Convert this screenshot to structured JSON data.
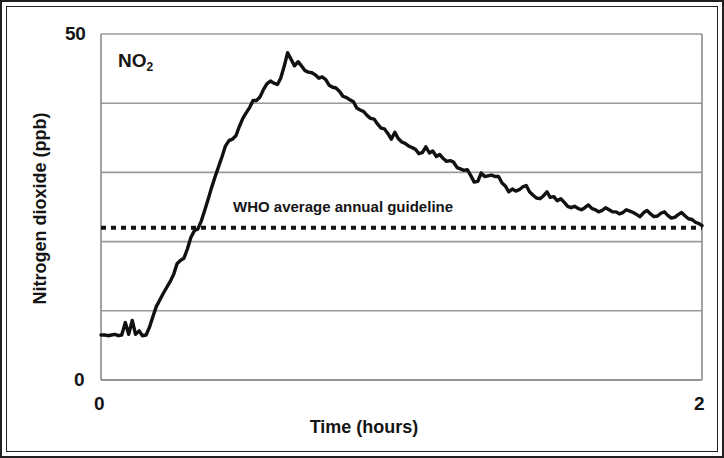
{
  "figure": {
    "series_label": "NO",
    "series_label_sub": "2",
    "annotation": "WHO average annual guideline"
  },
  "axes": {
    "x_title": "Time (hours)",
    "y_title": "Nitrogen dioxide (ppb)",
    "x_tick_min": "0",
    "x_tick_max": "2",
    "y_tick_min": "0",
    "y_tick_max": "50"
  },
  "colors": {
    "line": "#111111",
    "grid": "#9a9a9a",
    "axis": "#8c8c8c",
    "frame": "#231f20",
    "background": "#ffffff"
  },
  "chart_data": {
    "type": "line",
    "title": "",
    "xlabel": "Time (hours)",
    "ylabel": "Nitrogen dioxide (ppb)",
    "xlim": [
      0,
      2
    ],
    "ylim": [
      0,
      50
    ],
    "grid": true,
    "gridlines_y": [
      0,
      10,
      20,
      30,
      40,
      50
    ],
    "xticks": [
      0,
      2
    ],
    "yticks": [
      0,
      50
    ],
    "legend": "none",
    "annotations": [
      {
        "text": "NO2",
        "x": 0.09,
        "y": 46,
        "kind": "series-label"
      },
      {
        "text": "WHO average annual guideline",
        "x": 0.44,
        "y": 24.3,
        "kind": "threshold-label"
      }
    ],
    "threshold_line": {
      "label": "WHO average annual guideline",
      "value": 22.0,
      "style": "dotted",
      "orientation": "horizontal"
    },
    "series": [
      {
        "name": "NO2",
        "units": "ppb",
        "x": [
          0.0,
          0.012,
          0.023,
          0.035,
          0.046,
          0.058,
          0.069,
          0.081,
          0.092,
          0.104,
          0.115,
          0.127,
          0.138,
          0.15,
          0.161,
          0.173,
          0.184,
          0.196,
          0.207,
          0.219,
          0.23,
          0.242,
          0.253,
          0.265,
          0.276,
          0.288,
          0.299,
          0.311,
          0.322,
          0.334,
          0.345,
          0.357,
          0.368,
          0.38,
          0.391,
          0.403,
          0.414,
          0.426,
          0.437,
          0.449,
          0.46,
          0.472,
          0.483,
          0.495,
          0.506,
          0.518,
          0.529,
          0.541,
          0.552,
          0.564,
          0.575,
          0.587,
          0.598,
          0.61,
          0.621,
          0.633,
          0.644,
          0.656,
          0.667,
          0.679,
          0.69,
          0.702,
          0.713,
          0.725,
          0.736,
          0.748,
          0.759,
          0.771,
          0.782,
          0.794,
          0.805,
          0.817,
          0.828,
          0.84,
          0.851,
          0.863,
          0.874,
          0.886,
          0.897,
          0.909,
          0.92,
          0.932,
          0.943,
          0.955,
          0.966,
          0.978,
          0.989,
          1.001,
          1.012,
          1.024,
          1.035,
          1.047,
          1.058,
          1.07,
          1.081,
          1.093,
          1.104,
          1.116,
          1.127,
          1.139,
          1.15,
          1.162,
          1.173,
          1.185,
          1.196,
          1.208,
          1.219,
          1.231,
          1.242,
          1.254,
          1.265,
          1.277,
          1.288,
          1.3,
          1.311,
          1.323,
          1.334,
          1.346,
          1.357,
          1.369,
          1.38,
          1.392,
          1.403,
          1.415,
          1.426,
          1.438,
          1.449,
          1.461,
          1.472,
          1.484,
          1.495,
          1.507,
          1.518,
          1.53,
          1.541,
          1.553,
          1.564,
          1.576,
          1.587,
          1.599,
          1.61,
          1.622,
          1.633,
          1.645,
          1.656,
          1.668,
          1.679,
          1.691,
          1.702,
          1.714,
          1.725,
          1.737,
          1.748,
          1.76,
          1.771,
          1.783,
          1.794,
          1.806,
          1.817,
          1.829,
          1.84,
          1.852,
          1.863,
          1.875,
          1.886,
          1.898,
          1.909,
          1.921,
          1.932,
          1.944,
          1.955,
          1.967,
          1.978,
          1.99,
          2.0
        ],
        "y": [
          6.5,
          6.5,
          6.4,
          6.5,
          6.6,
          6.4,
          6.5,
          8.3,
          6.6,
          8.6,
          6.6,
          7.1,
          6.4,
          6.5,
          7.6,
          9.2,
          10.6,
          11.6,
          12.5,
          13.4,
          14.2,
          15.3,
          16.8,
          17.3,
          17.6,
          19.0,
          20.6,
          21.6,
          21.8,
          23.0,
          24.5,
          26.2,
          27.8,
          29.4,
          30.8,
          32.3,
          33.8,
          34.6,
          34.8,
          35.3,
          36.6,
          37.8,
          38.6,
          39.4,
          40.4,
          40.4,
          40.9,
          42.0,
          42.8,
          43.2,
          42.9,
          42.7,
          43.6,
          45.4,
          47.3,
          46.3,
          45.4,
          46.0,
          45.4,
          44.7,
          44.5,
          44.4,
          44.1,
          43.6,
          43.8,
          43.4,
          42.6,
          42.3,
          42.2,
          41.7,
          41.0,
          40.8,
          40.5,
          40.2,
          39.3,
          39.0,
          38.8,
          38.2,
          37.8,
          37.7,
          37.0,
          36.4,
          36.3,
          35.6,
          34.8,
          35.8,
          34.9,
          34.4,
          34.2,
          33.8,
          33.6,
          33.3,
          32.7,
          32.9,
          33.7,
          32.8,
          33.1,
          32.3,
          32.6,
          32.0,
          31.6,
          31.7,
          31.5,
          30.7,
          30.5,
          30.3,
          30.4,
          29.5,
          28.6,
          28.7,
          29.9,
          29.4,
          29.5,
          29.6,
          29.4,
          29.4,
          28.5,
          28.0,
          27.2,
          27.6,
          27.3,
          27.5,
          27.9,
          28.1,
          27.2,
          26.7,
          26.3,
          26.2,
          26.6,
          27.2,
          26.4,
          26.5,
          25.9,
          26.2,
          25.7,
          25.1,
          24.9,
          25.1,
          24.8,
          24.6,
          24.9,
          25.3,
          24.8,
          24.6,
          24.3,
          24.5,
          24.9,
          24.6,
          24.3,
          24.3,
          24.0,
          24.2,
          24.6,
          24.4,
          24.2,
          23.9,
          23.6,
          24.2,
          24.5,
          24.0,
          23.6,
          23.7,
          24.1,
          24.3,
          23.8,
          23.4,
          23.5,
          23.9,
          24.2,
          23.7,
          23.3,
          23.2,
          22.8,
          22.6,
          22.3
        ]
      }
    ]
  }
}
